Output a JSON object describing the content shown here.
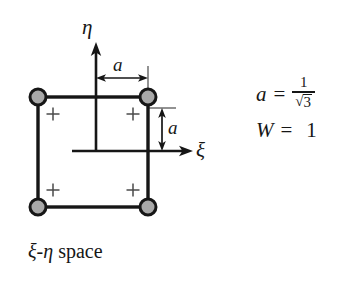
{
  "figure": {
    "caption": {
      "xi_symbol": "ξ",
      "dash": "-",
      "eta_symbol": "η",
      "word": "space",
      "full": "ξ-η space"
    },
    "axes": {
      "vertical_label": "η",
      "horizontal_label": "ξ",
      "vertical_name": "eta-axis",
      "horizontal_name": "xi-axis"
    },
    "dimensions": [
      {
        "name": "a-horizontal",
        "label": "a",
        "orientation": "horizontal"
      },
      {
        "name": "a-vertical",
        "label": "a",
        "orientation": "vertical"
      }
    ],
    "formulas": [
      {
        "name": "a-definition",
        "lhs": "a",
        "operator": "=",
        "numerator": "1",
        "radical_symbol": "√",
        "radicand": "3",
        "rendered": "a = 1/√3"
      },
      {
        "name": "w-definition",
        "lhs": "W",
        "operator": "=",
        "rhs": "1",
        "rendered": "W = 1"
      }
    ],
    "nodes": [
      {
        "name": "corner-node-top-left",
        "marker": "filled-circle",
        "cx": 38,
        "cy": 97
      },
      {
        "name": "corner-node-top-right",
        "marker": "filled-circle",
        "cx": 148,
        "cy": 97
      },
      {
        "name": "corner-node-bottom-left",
        "marker": "filled-circle",
        "cx": 38,
        "cy": 207
      },
      {
        "name": "corner-node-bottom-right",
        "marker": "filled-circle",
        "cx": 148,
        "cy": 207
      }
    ],
    "quadrature_points": [
      {
        "name": "quadrature-point-top-left",
        "marker": "plus",
        "cx": 53,
        "cy": 114
      },
      {
        "name": "quadrature-point-top-right",
        "marker": "plus",
        "cx": 133,
        "cy": 114
      },
      {
        "name": "quadrature-point-bottom-left",
        "marker": "plus",
        "cx": 53,
        "cy": 190
      },
      {
        "name": "quadrature-point-bottom-right",
        "marker": "plus",
        "cx": 133,
        "cy": 190
      }
    ],
    "element_square": {
      "name": "element-square",
      "x": 38,
      "y": 97,
      "width": 110,
      "height": 110
    },
    "colors": {
      "background": "#ffffff",
      "stroke": "#161616",
      "node_fill": "#a8a8a8",
      "thin_stroke": "#3a3a3a"
    }
  }
}
